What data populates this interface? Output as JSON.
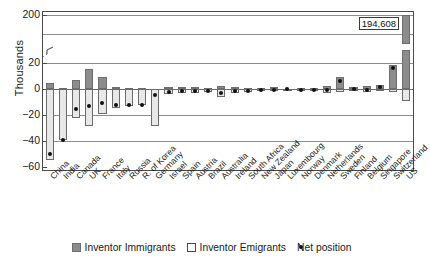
{
  "chart_data": {
    "type": "bar",
    "title": "",
    "xlabel": "",
    "ylabel": "Thousands",
    "grid": true,
    "legend_position": "bottom",
    "axis_break": {
      "between": [
        20,
        180
      ],
      "note": "broken y-axis between 20 and 200"
    },
    "ylim": [
      -60,
      200
    ],
    "yticks": [
      200,
      20,
      0,
      -20,
      -40,
      -60
    ],
    "ytick_labels": [
      "200",
      "20",
      "0",
      "−20",
      "−40",
      "−60"
    ],
    "annotations": [
      {
        "text": "194,608",
        "series": "Inventor Immigrants",
        "category": "US"
      }
    ],
    "categories": [
      "China",
      "India",
      "Canada",
      "UK",
      "France",
      "Italy",
      "Russia",
      "R. of Korea",
      "Germany",
      "Israel",
      "Spain",
      "Austria",
      "Brazil",
      "Australia",
      "Ireland",
      "South Africa",
      "New Zealand",
      "Japan",
      "Luxembourg",
      "Norway",
      "Denmark",
      "Netherlands",
      "Sweden",
      "Finland",
      "Belgium",
      "Singapore",
      "Switzerland",
      "US"
    ],
    "series": [
      {
        "name": "Inventor Immigrants",
        "color": "#8c8c8c",
        "values": [
          4.5,
          0.4,
          7.2,
          15.2,
          9.0,
          1.8,
          0.8,
          0.5,
          24.5,
          1.4,
          1.4,
          1.8,
          0.7,
          2.4,
          1.3,
          0.6,
          0.5,
          1.2,
          0.3,
          0.5,
          1.1,
          2.2,
          9.0,
          1.3,
          2.0,
          3.4,
          18.5,
          194.608
        ]
      },
      {
        "name": "Inventor Emigrants",
        "color": "#e8e8e8",
        "values": [
          -54.5,
          -39.6,
          -22.3,
          -28.4,
          -19.6,
          -14.3,
          -13.0,
          -12.6,
          -28.8,
          -3.6,
          -3.2,
          -3.0,
          -2.4,
          -5.8,
          -3.0,
          -2.2,
          -1.6,
          -1.8,
          -0.5,
          -1.0,
          -1.6,
          -3.0,
          -2.6,
          -1.2,
          -2.4,
          -1.6,
          -2.0,
          -9.6
        ]
      },
      {
        "name": "Net position",
        "color": "#111111",
        "values": [
          -50.0,
          -39.2,
          -15.1,
          -13.2,
          -10.6,
          -12.5,
          -12.2,
          -12.1,
          -4.3,
          -2.2,
          -1.8,
          -1.2,
          -1.7,
          -3.4,
          -1.7,
          -1.6,
          -1.1,
          -0.6,
          -0.2,
          -0.5,
          -0.5,
          -0.8,
          6.4,
          0.1,
          -0.4,
          1.8,
          16.5,
          185.0
        ]
      }
    ]
  },
  "legend": {
    "items": [
      {
        "label": "Inventor Immigrants",
        "marker": "filled-square"
      },
      {
        "label": "Inventor Emigrants",
        "marker": "open-square"
      },
      {
        "label": "Net position",
        "marker": "dot"
      }
    ]
  }
}
